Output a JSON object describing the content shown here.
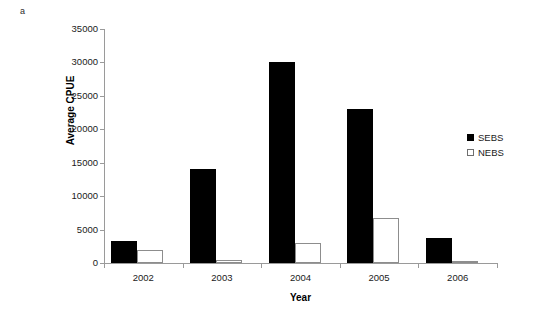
{
  "panel_label": "a",
  "chart_data": {
    "type": "bar",
    "title": "",
    "xlabel": "Year",
    "ylabel": "Average CPUE",
    "categories": [
      "2002",
      "2003",
      "2004",
      "2005",
      "2006"
    ],
    "series": [
      {
        "name": "SEBS",
        "color": "#000000",
        "fill": "solid",
        "values": [
          3300,
          14000,
          30000,
          23000,
          3700
        ]
      },
      {
        "name": "NEBS",
        "color": "#ffffff",
        "fill": "hollow",
        "values": [
          2000,
          400,
          3000,
          6700,
          200
        ]
      }
    ],
    "ylim": [
      0,
      35000
    ],
    "ytick_step": 5000,
    "yticks": [
      "35000",
      "30000",
      "25000",
      "20000",
      "15000",
      "10000",
      "5000",
      "0"
    ],
    "grid": false,
    "legend_position": "right"
  },
  "legend": {
    "items": [
      {
        "label": "SEBS"
      },
      {
        "label": "NEBS"
      }
    ]
  }
}
